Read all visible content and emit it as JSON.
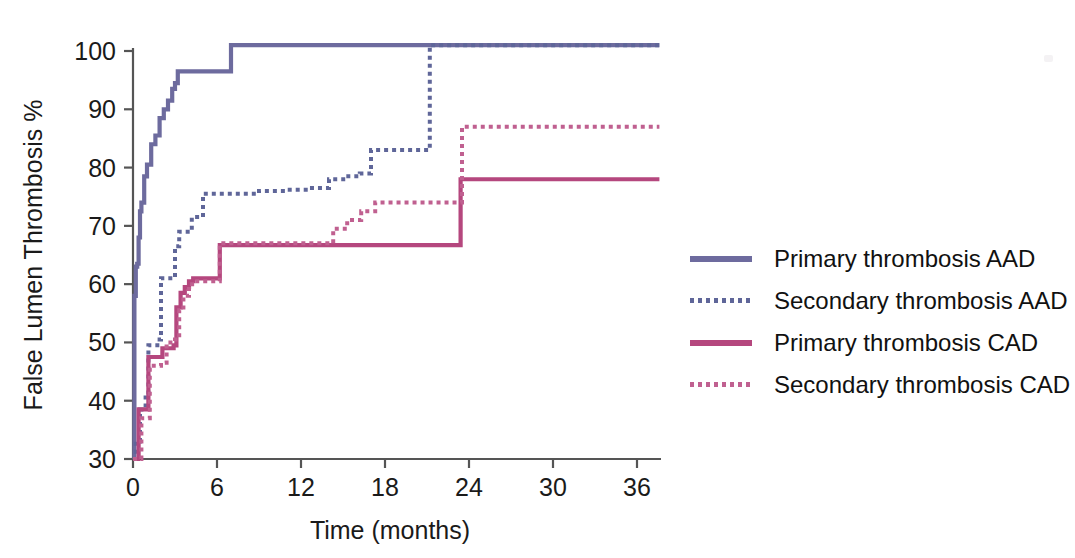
{
  "figure": {
    "background": "#ffffff",
    "axis_color": "#555555"
  },
  "axes": {
    "x": {
      "title": "Time (months)",
      "ticks": [
        0,
        6,
        12,
        18,
        24,
        30,
        36
      ],
      "tick_labels": [
        "0",
        "6",
        "12",
        "18",
        "24",
        "30",
        "36"
      ],
      "range": [
        0,
        38
      ]
    },
    "y": {
      "title": "False Lumen Thrombosis %",
      "ticks": [
        30,
        40,
        50,
        60,
        70,
        80,
        90,
        100
      ],
      "tick_labels": [
        "30",
        "40",
        "50",
        "60",
        "70",
        "80",
        "90",
        "100"
      ],
      "range": [
        30,
        102
      ]
    }
  },
  "legend": {
    "position": "right",
    "items": [
      {
        "label": "Primary thrombosis AAD",
        "color": "#6d6b9e",
        "style": "solid",
        "name": "primary-aad"
      },
      {
        "label": "Secondary thrombosis AAD",
        "color": "#5f6699",
        "style": "dotted",
        "name": "secondary-aad"
      },
      {
        "label": "Primary thrombosis CAD",
        "color": "#b5477e",
        "style": "solid",
        "name": "primary-cad"
      },
      {
        "label": "Secondary thrombosis CAD",
        "color": "#c06090",
        "style": "dotted",
        "name": "secondary-cad"
      }
    ]
  },
  "chart_data": {
    "type": "line",
    "subtype": "kaplan-meier-step",
    "title": "",
    "xlabel": "Time (months)",
    "ylabel": "False Lumen Thrombosis %",
    "xlim": [
      0,
      38
    ],
    "ylim": [
      30,
      102
    ],
    "grid": false,
    "legend_position": "right",
    "series": [
      {
        "name": "Primary thrombosis AAD",
        "color": "#6d6b9e",
        "style": "solid",
        "x": [
          0.0,
          0.1,
          0.2,
          0.3,
          0.4,
          0.5,
          0.6,
          0.8,
          1.0,
          1.3,
          1.6,
          1.9,
          2.2,
          2.5,
          2.8,
          3.0,
          3.2,
          7.0,
          37.6
        ],
        "y": [
          30.0,
          58.0,
          63.0,
          63.5,
          68.0,
          72.5,
          74.0,
          78.5,
          80.5,
          84.0,
          85.5,
          88.5,
          90.0,
          91.5,
          93.5,
          94.5,
          96.5,
          101.0,
          101.0
        ]
      },
      {
        "name": "Secondary thrombosis AAD",
        "color": "#5f6699",
        "style": "dotted",
        "x": [
          0.0,
          0.2,
          0.5,
          0.9,
          1.1,
          1.9,
          2.0,
          3.0,
          3.3,
          4.2,
          5.0,
          6.2,
          9.0,
          11.0,
          12.6,
          14.0,
          15.2,
          16.2,
          17.0,
          20.3,
          21.2,
          37.6
        ],
        "y": [
          30.0,
          33.0,
          38.5,
          41.0,
          49.5,
          50.5,
          61.0,
          66.5,
          69.0,
          71.5,
          75.5,
          75.5,
          76.0,
          76.2,
          76.5,
          78.0,
          78.5,
          79.0,
          83.0,
          83.0,
          101.0,
          101.0
        ]
      },
      {
        "name": "Primary thrombosis CAD",
        "color": "#b5477e",
        "style": "solid",
        "x": [
          0.0,
          0.4,
          0.9,
          1.1,
          1.9,
          2.1,
          2.9,
          3.1,
          3.4,
          3.7,
          4.0,
          4.3,
          4.6,
          6.2,
          23.0,
          23.4,
          37.6
        ],
        "y": [
          30.0,
          38.5,
          38.5,
          47.5,
          47.5,
          49.0,
          49.5,
          56.0,
          58.5,
          59.5,
          60.5,
          61.0,
          61.0,
          66.7,
          66.7,
          78.0,
          78.0
        ]
      },
      {
        "name": "Secondary thrombosis CAD",
        "color": "#c06090",
        "style": "dotted",
        "x": [
          0.0,
          0.6,
          1.0,
          1.2,
          2.0,
          2.4,
          3.0,
          3.3,
          3.6,
          4.0,
          4.4,
          4.8,
          6.2,
          13.5,
          14.3,
          15.3,
          16.3,
          17.3,
          18.0,
          23.1,
          23.5,
          37.6
        ],
        "y": [
          30.0,
          37.0,
          37.0,
          46.0,
          46.5,
          50.0,
          50.5,
          55.5,
          58.0,
          60.0,
          60.5,
          60.5,
          67.0,
          67.0,
          69.5,
          71.0,
          72.5,
          74.0,
          74.0,
          74.0,
          87.0,
          87.0
        ]
      }
    ]
  }
}
